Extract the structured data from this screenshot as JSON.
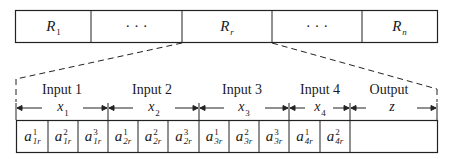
{
  "top_row": {
    "cells": [
      {
        "base": "R",
        "sub": "1"
      },
      {
        "text": "· · ·"
      },
      {
        "base": "R",
        "sub": "r"
      },
      {
        "text": "· · ·"
      },
      {
        "base": "R",
        "sub": "n"
      }
    ]
  },
  "segments": [
    {
      "label": "Input 1",
      "var": "x",
      "var_sub": "1"
    },
    {
      "label": "Input 2",
      "var": "x",
      "var_sub": "2"
    },
    {
      "label": "Input 3",
      "var": "x",
      "var_sub": "3"
    },
    {
      "label": "Input 4",
      "var": "x",
      "var_sub": "4"
    },
    {
      "label": "Output",
      "var": "z",
      "var_sub": ""
    }
  ],
  "bottom_row": {
    "cells": [
      {
        "base": "a",
        "sup": "1",
        "sub": "1r"
      },
      {
        "base": "a",
        "sup": "2",
        "sub": "1r"
      },
      {
        "base": "a",
        "sup": "3",
        "sub": "1r"
      },
      {
        "base": "a",
        "sup": "1",
        "sub": "2r"
      },
      {
        "base": "a",
        "sup": "2",
        "sub": "2r"
      },
      {
        "base": "a",
        "sup": "3",
        "sub": "2r"
      },
      {
        "base": "a",
        "sup": "1",
        "sub": "3r"
      },
      {
        "base": "a",
        "sup": "2",
        "sub": "3r"
      },
      {
        "base": "a",
        "sup": "3",
        "sub": "3r"
      },
      {
        "base": "a",
        "sup": "1",
        "sub": "4r"
      },
      {
        "base": "a",
        "sup": "2",
        "sub": "4r"
      },
      {
        "base": "a",
        "sup": "3",
        "sub": "4r"
      },
      {
        "base": "s"
      }
    ]
  }
}
